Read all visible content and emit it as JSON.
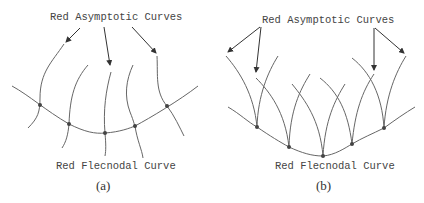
{
  "panels": [
    {
      "id": "a",
      "title": "Red Asymptotic Curves",
      "curve_label": "Red Flecnodal Curve",
      "caption": "(a)",
      "flecnodal_points": [
        [
          40,
          105
        ],
        [
          69,
          124
        ],
        [
          105,
          133
        ],
        [
          135,
          126
        ],
        [
          167,
          106
        ]
      ],
      "asymptotic_curve_count": 5,
      "arrow_count": 3
    },
    {
      "id": "b",
      "title": "Red Asymptotic Curves",
      "curve_label": "Red Flecnodal Curve",
      "caption": "(b)",
      "flecnodal_points": [
        [
          257,
          127
        ],
        [
          289,
          147
        ],
        [
          323,
          156
        ],
        [
          352,
          144
        ],
        [
          384,
          128
        ]
      ],
      "asymptotic_curve_count": 10,
      "arrow_count": 4
    }
  ],
  "colors": {
    "stroke": "#666666",
    "text": "#444444",
    "background": "#ffffff"
  }
}
